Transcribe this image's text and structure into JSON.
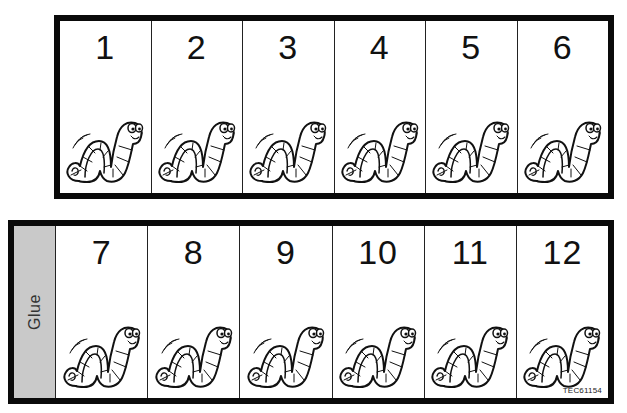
{
  "sheet": {
    "top_row": {
      "cards": [
        {
          "number": "1",
          "icon": "worm-icon"
        },
        {
          "number": "2",
          "icon": "worm-icon"
        },
        {
          "number": "3",
          "icon": "worm-icon"
        },
        {
          "number": "4",
          "icon": "worm-icon"
        },
        {
          "number": "5",
          "icon": "worm-icon"
        },
        {
          "number": "6",
          "icon": "worm-icon"
        }
      ]
    },
    "bottom_row": {
      "glue_label": "Glue",
      "cards": [
        {
          "number": "7",
          "icon": "worm-icon"
        },
        {
          "number": "8",
          "icon": "worm-icon"
        },
        {
          "number": "9",
          "icon": "worm-icon"
        },
        {
          "number": "10",
          "icon": "worm-icon"
        },
        {
          "number": "11",
          "icon": "worm-icon"
        },
        {
          "number": "12",
          "icon": "worm-icon"
        }
      ],
      "product_code": "TEC61154"
    },
    "colors": {
      "border": "#0a0a0a",
      "glue_strip": "#c9c9c9",
      "background": "#ffffff"
    }
  }
}
